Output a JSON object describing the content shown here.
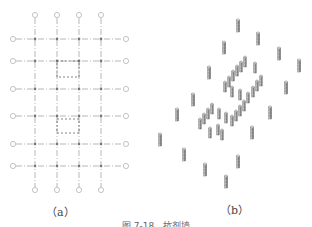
{
  "figure": {
    "panel_a": {
      "label": "（a）",
      "type": "plan-grid",
      "vertical_axes_x": [
        35,
        57,
        79,
        101
      ],
      "horizontal_axes_y": [
        39,
        61,
        89,
        116,
        144,
        166
      ],
      "top_bubble_y": 15,
      "bottom_bubble_y": 190,
      "left_bubble_x": 13,
      "right_bubble_x": 126,
      "core_box": {
        "x1": 57,
        "y1": 75,
        "x2": 79,
        "y2": 130
      },
      "colors": {
        "line": "#9a9a9a",
        "node": "#777777",
        "bubble": "#aaaaaa"
      }
    },
    "panel_b": {
      "label": "（b）",
      "type": "isometric-columns",
      "columns": [
        {
          "x": 238,
          "y": 20
        },
        {
          "x": 258,
          "y": 33
        },
        {
          "x": 224,
          "y": 42
        },
        {
          "x": 279,
          "y": 48
        },
        {
          "x": 299,
          "y": 60
        },
        {
          "x": 209,
          "y": 67
        },
        {
          "x": 286,
          "y": 82
        },
        {
          "x": 193,
          "y": 94
        },
        {
          "x": 270,
          "y": 107
        },
        {
          "x": 177,
          "y": 109
        },
        {
          "x": 252,
          "y": 127
        },
        {
          "x": 160,
          "y": 134
        },
        {
          "x": 184,
          "y": 149
        },
        {
          "x": 238,
          "y": 156
        },
        {
          "x": 205,
          "y": 164
        },
        {
          "x": 226,
          "y": 176
        }
      ],
      "core_walls": [
        {
          "x": 245,
          "y": 57,
          "h": 10
        },
        {
          "x": 241,
          "y": 62,
          "h": 10
        },
        {
          "x": 237,
          "y": 66,
          "h": 10
        },
        {
          "x": 233,
          "y": 71,
          "h": 10
        },
        {
          "x": 229,
          "y": 77,
          "h": 10
        },
        {
          "x": 225,
          "y": 82,
          "h": 10
        },
        {
          "x": 232,
          "y": 87,
          "h": 10
        },
        {
          "x": 240,
          "y": 90,
          "h": 10
        },
        {
          "x": 248,
          "y": 93,
          "h": 10
        },
        {
          "x": 253,
          "y": 87,
          "h": 10
        },
        {
          "x": 257,
          "y": 81,
          "h": 10
        },
        {
          "x": 261,
          "y": 76,
          "h": 10
        },
        {
          "x": 255,
          "y": 63,
          "h": 10
        },
        {
          "x": 212,
          "y": 104,
          "h": 10
        },
        {
          "x": 208,
          "y": 109,
          "h": 10
        },
        {
          "x": 204,
          "y": 114,
          "h": 10
        },
        {
          "x": 200,
          "y": 119,
          "h": 10
        },
        {
          "x": 219,
          "y": 109,
          "h": 10
        },
        {
          "x": 226,
          "y": 113,
          "h": 10
        },
        {
          "x": 232,
          "y": 116,
          "h": 10
        },
        {
          "x": 236,
          "y": 111,
          "h": 10
        },
        {
          "x": 240,
          "y": 106,
          "h": 10
        },
        {
          "x": 244,
          "y": 101,
          "h": 10
        },
        {
          "x": 218,
          "y": 125,
          "h": 10
        },
        {
          "x": 222,
          "y": 130,
          "h": 10
        },
        {
          "x": 210,
          "y": 128,
          "h": 10
        }
      ],
      "colors": {
        "body": "#8c8c8c",
        "light": "#d0d0d0",
        "dark": "#555555"
      }
    },
    "caption": "图 7-18　抗剂墙"
  }
}
